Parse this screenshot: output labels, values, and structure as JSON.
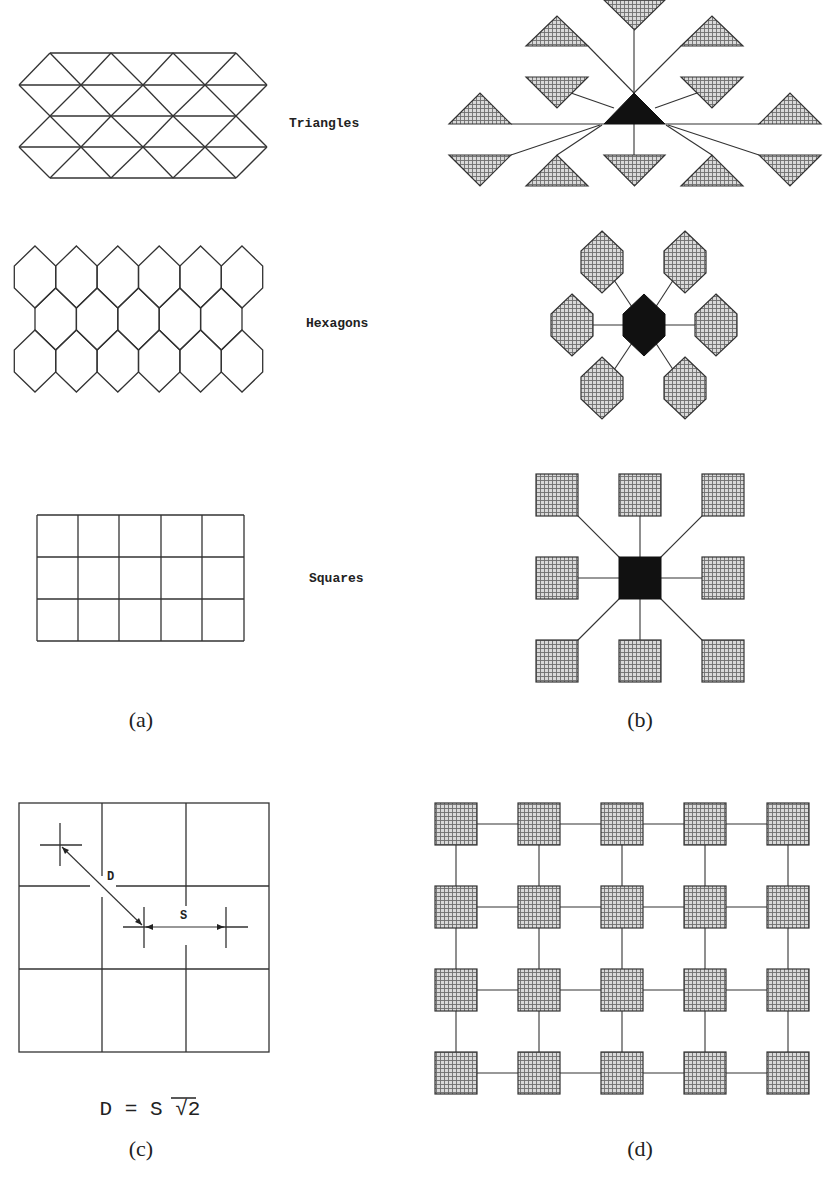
{
  "figure": {
    "colors": {
      "line": "#333333",
      "solid": "#111111",
      "hatch_bg": "#d6d6d6",
      "hatch_line": "#7a7a7a",
      "background": "#ffffff"
    },
    "panel_a": {
      "caption": "(a)",
      "triangles": {
        "label": "Triangles"
      },
      "hexagons": {
        "label": "Hexagons"
      },
      "squares": {
        "label": "Squares"
      }
    },
    "panel_b": {
      "caption": "(b)",
      "triangle_neighbors": "12 hatched triangles linked to central black triangle",
      "hexagon_neighbors": "6 hatched hexagons linked to central black hexagon",
      "square_neighbors": "8 hatched squares linked to central black square"
    },
    "panel_c": {
      "caption": "(c)",
      "diagonal_label": "D",
      "side_label": "S",
      "formula": "D = S √2"
    },
    "panel_d": {
      "caption": "(d)",
      "rows": 4,
      "cols": 5
    }
  }
}
